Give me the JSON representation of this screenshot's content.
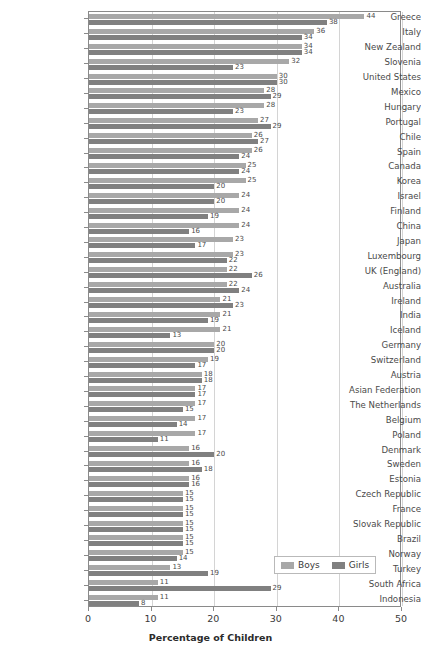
{
  "chart_data": {
    "type": "bar",
    "orientation": "horizontal",
    "title": "",
    "xlabel": "Percentage of Children",
    "ylabel": "",
    "xlim": [
      0,
      50
    ],
    "xticks": [
      0,
      10,
      20,
      30,
      40,
      50
    ],
    "grid": true,
    "legend_position": "bottom-right",
    "colors": {
      "boys": "#a8a8a8",
      "girls": "#808080"
    },
    "series": [
      {
        "name": "Boys",
        "color": "#a8a8a8",
        "values": [
          44,
          36,
          34,
          32,
          30,
          28,
          28,
          27,
          26,
          26,
          25,
          25,
          24,
          24,
          24,
          23,
          23,
          22,
          22,
          21,
          21,
          21,
          20,
          19,
          18,
          17,
          17,
          17,
          17,
          16,
          16,
          16,
          15,
          15,
          15,
          15,
          15,
          13,
          11,
          11
        ]
      },
      {
        "name": "Girls",
        "color": "#808080",
        "values": [
          38,
          34,
          34,
          23,
          30,
          29,
          23,
          29,
          27,
          24,
          24,
          20,
          20,
          19,
          16,
          17,
          22,
          26,
          24,
          23,
          19,
          13,
          20,
          17,
          18,
          17,
          15,
          14,
          11,
          20,
          18,
          16,
          15,
          15,
          15,
          15,
          14,
          19,
          29,
          8
        ]
      }
    ],
    "categories": [
      "Greece",
      "Italy",
      "New Zealand",
      "Slovenia",
      "United States",
      "Mexico",
      "Hungary",
      "Portugal",
      "Chile",
      "Spain",
      "Canada",
      "Korea",
      "Israel",
      "Finland",
      "China",
      "Japan",
      "Luxembourg",
      "UK (England)",
      "Australia",
      "Ireland",
      "India",
      "Iceland",
      "Germany",
      "Switzerland",
      "Austria",
      "Asian Federation",
      "The Netherlands",
      "Belgium",
      "Poland",
      "Denmark",
      "Sweden",
      "Estonia",
      "Czech Republic",
      "France",
      "Slovak Republic",
      "Brazil",
      "Norway",
      "Turkey",
      "South Africa",
      "Indonesia"
    ]
  },
  "legend": {
    "items": [
      {
        "label": "Boys",
        "color": "#a8a8a8"
      },
      {
        "label": "Girls",
        "color": "#808080"
      }
    ]
  },
  "axis": {
    "x_title": "Percentage of Children",
    "x_tick_labels": [
      "0",
      "10",
      "20",
      "30",
      "40",
      "50"
    ]
  }
}
